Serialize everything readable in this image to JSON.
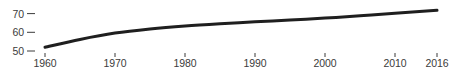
{
  "chart_data": {
    "type": "line",
    "title": "",
    "subtitle": "",
    "xlabel": "",
    "ylabel": "",
    "x": [
      1960,
      1965,
      1970,
      1975,
      1980,
      1985,
      1990,
      1995,
      2000,
      2005,
      2010,
      2016
    ],
    "values": [
      52.0,
      56.2,
      59.6,
      61.8,
      63.4,
      64.6,
      65.6,
      66.6,
      67.6,
      68.8,
      70.2,
      71.8
    ],
    "series": [
      {
        "name": "value",
        "values": [
          52.0,
          56.2,
          59.6,
          61.8,
          63.4,
          64.6,
          65.6,
          66.6,
          67.6,
          68.8,
          70.2,
          71.8
        ]
      }
    ],
    "xlim": [
      1960,
      2016
    ],
    "ylim": [
      50,
      73
    ],
    "xticks": [
      1960,
      1970,
      1980,
      1990,
      2000,
      2010,
      2016
    ],
    "xticklabels": [
      "1960",
      "1970",
      "1980",
      "1990",
      "2000",
      "2010",
      "2016"
    ],
    "yticks": [
      50,
      60,
      70
    ],
    "yticklabels": [
      "50",
      "60",
      "70"
    ],
    "grid": false,
    "legend": false,
    "legend_position": "none",
    "line_color": "#1f1f1f",
    "line_width": 3,
    "tick_color": "#3b3b3b",
    "label_color": "#3b3b3b",
    "background_color": "#ffffff",
    "annotations": []
  }
}
